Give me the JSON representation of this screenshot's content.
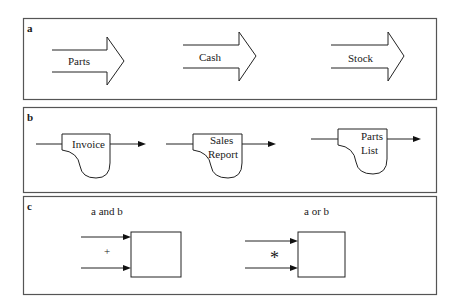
{
  "panels": {
    "a": {
      "label": "a",
      "arrows": [
        {
          "label": "Parts"
        },
        {
          "label": "Cash"
        },
        {
          "label": "Stock"
        }
      ]
    },
    "b": {
      "label": "b",
      "documents": [
        {
          "line1": "Invoice",
          "line2": ""
        },
        {
          "line1": "Sales",
          "line2": "Report"
        },
        {
          "line1": "Parts",
          "line2": "List"
        }
      ]
    },
    "c": {
      "label": "c",
      "groups": [
        {
          "title": "a and b",
          "operator": "+"
        },
        {
          "title": "a or b",
          "operator": "*"
        }
      ]
    }
  },
  "colors": {
    "line": "#222222",
    "frame": "#555555",
    "background": "#ffffff"
  }
}
